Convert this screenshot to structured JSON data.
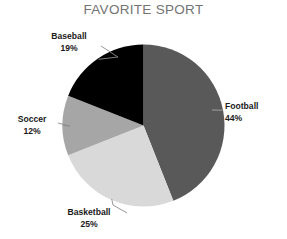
{
  "chart_data": {
    "type": "pie",
    "title": "FAVORITE SPORT",
    "xlabel": "",
    "ylabel": "",
    "legend": "none",
    "grid": false,
    "start_angle_deg": 0,
    "direction": "clockwise",
    "categories": [
      "Football",
      "Basketball",
      "Soccer",
      "Baseball"
    ],
    "values": [
      44,
      25,
      12,
      19
    ],
    "unit": "%",
    "colors": [
      "#595959",
      "#D9D9D9",
      "#A6A6A6",
      "#000000"
    ],
    "slices": [
      {
        "label": "Football",
        "value": 44,
        "value_text": "44%",
        "color": "#595959"
      },
      {
        "label": "Basketball",
        "value": 25,
        "value_text": "25%",
        "color": "#D9D9D9"
      },
      {
        "label": "Soccer",
        "value": 12,
        "value_text": "12%",
        "color": "#A6A6A6"
      },
      {
        "label": "Baseball",
        "value": 19,
        "value_text": "19%",
        "color": "#000000"
      }
    ],
    "annotations": [
      "Leader lines connect each outside label to its slice"
    ]
  },
  "labels": {
    "football": {
      "name": "Football",
      "value": "44%"
    },
    "basketball": {
      "name": "Basketball",
      "value": "25%"
    },
    "soccer": {
      "name": "Soccer",
      "value": "12%"
    },
    "baseball": {
      "name": "Baseball",
      "value": "19%"
    }
  },
  "style": {
    "title_color": "#737373",
    "label_color": "#1a1a1a",
    "leader_line_color": "#8c8c8c",
    "background": "#ffffff"
  }
}
